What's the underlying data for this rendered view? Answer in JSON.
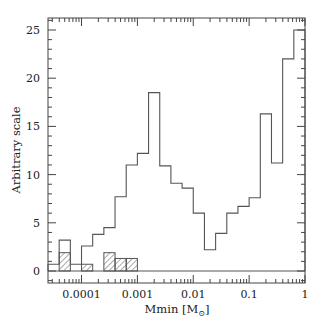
{
  "chart_data": {
    "type": "bar",
    "subtype": "step-histogram",
    "title": "",
    "xlabel": "Mmin [M⊙]",
    "ylabel": "Arbitrary scale",
    "xscale": "log",
    "xlim_log10": [
      -4.6,
      0.0
    ],
    "ylim": [
      -1.2,
      26.2
    ],
    "x_ticks": [
      {
        "value": 0.0001,
        "label": "0.0001"
      },
      {
        "value": 0.001,
        "label": "0.001"
      },
      {
        "value": 0.01,
        "label": "0.01"
      },
      {
        "value": 0.1,
        "label": "0.1"
      },
      {
        "value": 1,
        "label": "1"
      }
    ],
    "y_ticks": [
      {
        "value": 0,
        "label": "0"
      },
      {
        "value": 5,
        "label": "5"
      },
      {
        "value": 10,
        "label": "10"
      },
      {
        "value": 15,
        "label": "15"
      },
      {
        "value": 20,
        "label": "20"
      },
      {
        "value": 25,
        "label": "25"
      }
    ],
    "bin_width_log10": 0.2,
    "bin_edges_log10": [
      -4.6,
      -4.4,
      -4.2,
      -4.0,
      -3.8,
      -3.6,
      -3.4,
      -3.2,
      -3.0,
      -2.8,
      -2.6,
      -2.4,
      -2.2,
      -2.0,
      -1.8,
      -1.6,
      -1.4,
      -1.2,
      -1.0,
      -0.8,
      -0.6,
      -0.4,
      -0.2,
      0.0
    ],
    "series": [
      {
        "name": "all",
        "style": "open",
        "values": [
          0.7,
          3.2,
          0.7,
          2.6,
          3.8,
          4.5,
          7.7,
          11.0,
          12.2,
          18.5,
          10.9,
          9.1,
          8.6,
          6.0,
          2.2,
          3.9,
          6.0,
          6.7,
          7.6,
          16.3,
          11.2,
          22.0,
          25.0
        ]
      },
      {
        "name": "subset",
        "style": "hatched",
        "values": [
          0,
          1.9,
          0,
          0.7,
          0,
          1.9,
          1.3,
          1.3,
          0,
          0,
          0,
          0,
          0,
          0,
          0,
          0,
          0,
          0,
          0,
          0,
          0,
          0,
          0
        ]
      }
    ],
    "grid": false,
    "legend": null
  },
  "colors": {
    "line": "#555555",
    "axis": "#444444",
    "hatch": "#555555",
    "background": "#ffffff"
  }
}
